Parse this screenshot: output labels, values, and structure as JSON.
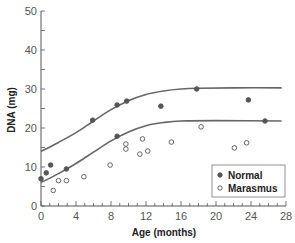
{
  "chart_data": {
    "type": "scatter",
    "title": "",
    "xlabel": "Age (months)",
    "ylabel": "DNA (mg)",
    "xlim": [
      0,
      28
    ],
    "ylim": [
      0,
      50
    ],
    "x_ticks": [
      0,
      4,
      8,
      12,
      16,
      20,
      24,
      28
    ],
    "x_minor_step": 1,
    "y_ticks": [
      0,
      10,
      20,
      30,
      40,
      50
    ],
    "y_minor_step": 5,
    "grid": false,
    "legend_position": "lower right",
    "series": [
      {
        "name": "Normal",
        "marker": "filled-circle",
        "color": "#555555",
        "points": [
          [
            0,
            7
          ],
          [
            0.6,
            8.5
          ],
          [
            1.1,
            10.5
          ],
          [
            2.9,
            9.5
          ],
          [
            5.9,
            22
          ],
          [
            8.7,
            25.9
          ],
          [
            9.8,
            26.9
          ],
          [
            8.7,
            17.9
          ],
          [
            13.7,
            25.6
          ],
          [
            17.8,
            30
          ],
          [
            23.7,
            27.2
          ],
          [
            25.6,
            21.8
          ]
        ]
      },
      {
        "name": "Marasmus",
        "marker": "open-circle",
        "color": "#555555",
        "points": [
          [
            1.4,
            4
          ],
          [
            2,
            6.5
          ],
          [
            2.9,
            6.5
          ],
          [
            4.9,
            7.5
          ],
          [
            7.9,
            10.5
          ],
          [
            9.7,
            15.9
          ],
          [
            9.7,
            14.6
          ],
          [
            11.3,
            13.3
          ],
          [
            11.6,
            17.2
          ],
          [
            12.2,
            14.1
          ],
          [
            14.9,
            16.4
          ],
          [
            18.3,
            20.3
          ],
          [
            22.1,
            14.9
          ],
          [
            23.5,
            16.2
          ]
        ]
      }
    ],
    "curves": [
      {
        "name": "upper-fit",
        "points": [
          [
            0,
            14
          ],
          [
            2,
            16.3
          ],
          [
            4,
            18.8
          ],
          [
            6,
            21.8
          ],
          [
            8,
            24.7
          ],
          [
            10,
            27.0
          ],
          [
            12,
            28.6
          ],
          [
            14,
            29.5
          ],
          [
            16,
            30.0
          ],
          [
            18,
            30.2
          ],
          [
            22,
            30.3
          ],
          [
            27.5,
            30.3
          ]
        ]
      },
      {
        "name": "lower-fit",
        "points": [
          [
            0,
            6
          ],
          [
            2,
            8.3
          ],
          [
            4,
            10.9
          ],
          [
            6,
            13.8
          ],
          [
            8,
            16.7
          ],
          [
            10,
            19.0
          ],
          [
            12,
            20.6
          ],
          [
            14,
            21.4
          ],
          [
            16,
            21.8
          ],
          [
            20,
            21.9
          ],
          [
            27.5,
            21.8
          ]
        ]
      }
    ]
  },
  "legend": {
    "items": [
      {
        "label": "Normal",
        "marker": "filled"
      },
      {
        "label": "Marasmus",
        "marker": "open"
      }
    ]
  },
  "axes": {
    "x_title": "Age (months)",
    "y_title": "DNA (mg)",
    "x_tick_labels": [
      "0",
      "4",
      "8",
      "12",
      "16",
      "20",
      "24",
      "28"
    ],
    "y_tick_labels": [
      "0",
      "10",
      "20",
      "30",
      "40",
      "50"
    ]
  }
}
